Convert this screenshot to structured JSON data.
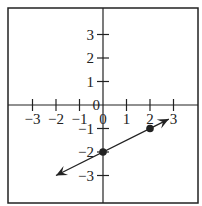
{
  "chart_data": {
    "type": "line",
    "title": "",
    "xlabel": "",
    "ylabel": "",
    "xlim": [
      -3.8,
      4.0
    ],
    "ylim": [
      -4.0,
      4.0
    ],
    "grid": false,
    "x_ticks": [
      "-3",
      "-2",
      "-1",
      "0",
      "1",
      "2",
      "3"
    ],
    "y_ticks": [
      "3",
      "2",
      "1",
      "0",
      "-1",
      "-2",
      "-3"
    ],
    "series": [
      {
        "name": "line",
        "points": [
          {
            "x": 0,
            "y": -2
          },
          {
            "x": 2,
            "y": -1
          }
        ],
        "slope": 0.5,
        "intercept": -2,
        "arrows": "both",
        "extent": {
          "x_start": -2,
          "x_end": 2.8
        }
      }
    ]
  },
  "labels": {
    "x": [
      "−3",
      "−2",
      "−1",
      "0",
      "1",
      "2",
      "3"
    ],
    "y": [
      "3",
      "2",
      "1",
      "0",
      "−1",
      "−2",
      "−3"
    ]
  }
}
